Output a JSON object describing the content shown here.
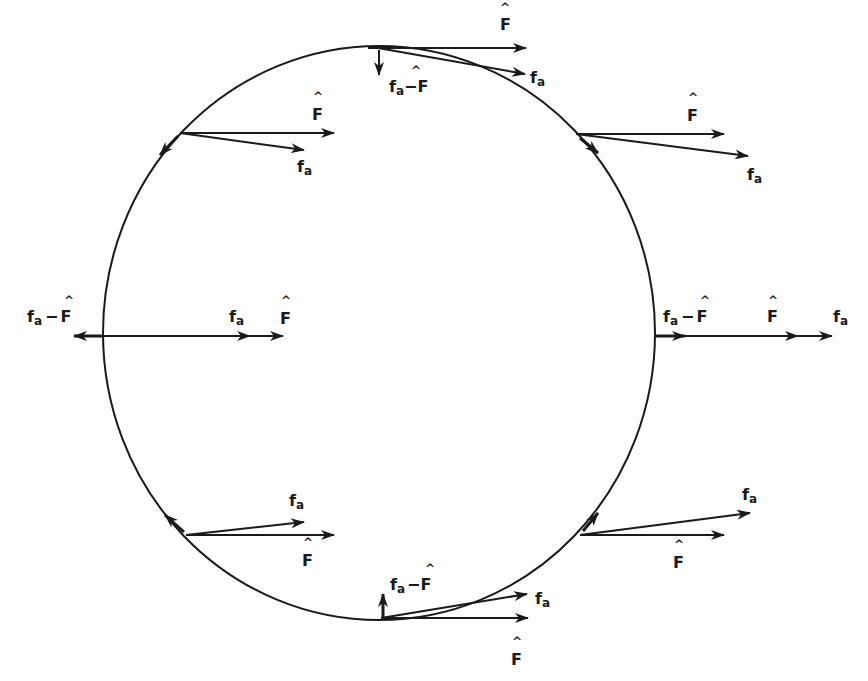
{
  "diagram": {
    "title": "",
    "colors": {
      "ink": "#1a1a1a",
      "background": "#ffffff"
    },
    "circle": {
      "cx": 379,
      "cy": 333,
      "rx": 276,
      "ry": 287
    },
    "labels": {
      "F_hat": "F",
      "f_a": "f",
      "f_a_sub": "a",
      "diff_prefix": "f",
      "diff_sub": "a",
      "diff_minus": "−",
      "diff_F": "F",
      "hat_glyph": "^"
    },
    "points": [
      {
        "name": "top",
        "position": [
          379,
          47
        ],
        "vectors": [
          "F_hat",
          "f_a",
          "f_a - F_hat (down)"
        ]
      },
      {
        "name": "upper-left",
        "position": [
          180,
          133
        ],
        "vectors": [
          "F_hat",
          "f_a",
          "f_a - F_hat (tangent)"
        ]
      },
      {
        "name": "upper-right",
        "position": [
          578,
          133
        ],
        "vectors": [
          "F_hat",
          "f_a",
          "f_a - F_hat (tangent)"
        ]
      },
      {
        "name": "left",
        "position": [
          103,
          336
        ],
        "vectors": [
          "f_a",
          "F_hat",
          "f_a - F_hat (left)"
        ]
      },
      {
        "name": "right",
        "position": [
          655,
          336
        ],
        "vectors": [
          "f_a - F_hat",
          "F_hat",
          "f_a"
        ]
      },
      {
        "name": "lower-left",
        "position": [
          186,
          535
        ],
        "vectors": [
          "f_a",
          "F_hat",
          "f_a - F_hat (tangent)"
        ]
      },
      {
        "name": "lower-right",
        "position": [
          580,
          535
        ],
        "vectors": [
          "f_a",
          "F_hat",
          "f_a - F_hat (tangent)"
        ]
      },
      {
        "name": "bottom",
        "position": [
          381,
          619
        ],
        "vectors": [
          "f_a - F_hat (up)",
          "f_a",
          "F_hat"
        ]
      }
    ]
  }
}
